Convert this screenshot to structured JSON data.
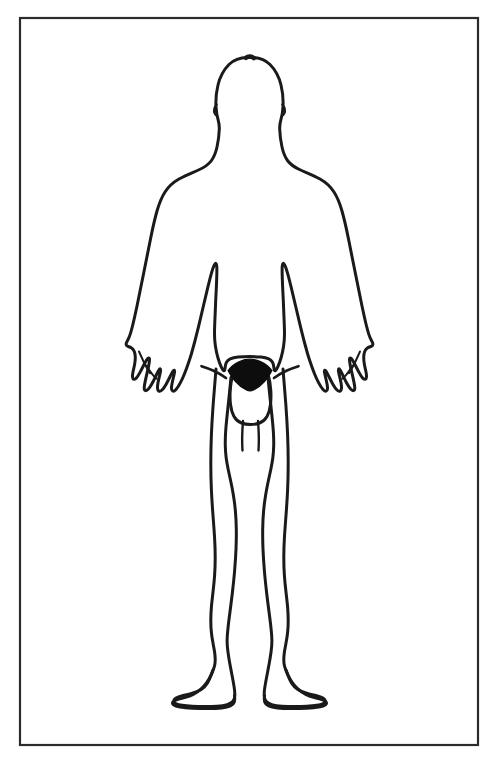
{
  "document": {
    "type": "anatomical-body-diagram",
    "title": "Human Body Outline Diagram",
    "view": "anterior",
    "subject_sex": "male",
    "style": "black-line-art-on-white",
    "labels": [],
    "annotations": [],
    "caption": ""
  },
  "colors": {
    "background": "#ffffff",
    "outline": "#1a1a1a",
    "frame": "#2b2b2b",
    "fill_pubic": "#0d0d0d",
    "speck": "#d8d8d8"
  },
  "frame": {
    "name": "border-rectangle",
    "x": 20,
    "y": 18,
    "width": 458,
    "height": 727,
    "stroke_width": 2.2,
    "fill": "none"
  },
  "figure": {
    "name": "human-body-outline",
    "stroke_width": 3.0,
    "parts": [
      {
        "name": "head",
        "filled": false
      },
      {
        "name": "neck",
        "filled": false
      },
      {
        "name": "torso",
        "filled": false
      },
      {
        "name": "left-arm",
        "filled": false
      },
      {
        "name": "right-arm",
        "filled": false
      },
      {
        "name": "left-hand",
        "filled": false
      },
      {
        "name": "right-hand",
        "filled": false
      },
      {
        "name": "left-leg",
        "filled": false
      },
      {
        "name": "right-leg",
        "filled": false
      },
      {
        "name": "left-foot",
        "filled": false
      },
      {
        "name": "right-foot",
        "filled": false
      },
      {
        "name": "genitalia",
        "filled": false
      },
      {
        "name": "pubic-hair-triangle",
        "filled": true
      }
    ],
    "facial_features": "none",
    "bounds": {
      "top": 56,
      "bottom": 714,
      "left": 126,
      "right": 372
    },
    "body_outline_path": "M 249.5 57.5 C 241.5 57.0 234.0 59.5 229.0 64.5 C 223.5 70.0 219.8 77.5 218.0 85.0 C 216.3 92.0 215.6 99.5 216.0 106.5 C 216.3 111.6 217.0 116.2 218.2 120.2 C 219.0 123.0 219.4 126.0 219.3 129.0 C 219.1 135.5 218.2 141.5 217.0 147.0 C 215.8 152.4 214.0 157.0 211.5 160.5 C 208.5 164.6 204.0 167.6 198.5 170.0 C 192.0 172.9 185.0 175.6 179.0 179.0 C 173.0 182.4 168.5 186.5 165.0 192.0 C 161.5 197.5 159.0 204.0 157.0 211.0 C 154.6 219.5 152.5 229.0 150.5 239.0 C 148.2 250.5 145.8 262.5 143.5 274.0 C 141.2 285.5 139.0 296.5 137.0 306.0 C 135.3 314.0 133.8 320.8 132.5 326.0 C 131.3 330.8 130.2 334.5 129.2 337.0 C 128.4 339.0 127.6 340.4 127.0 341.5 C 126.3 342.7 126.0 343.7 126.2 344.6 C 126.4 345.6 127.2 346.2 128.2 346.5 C 129.4 346.9 130.6 347.3 131.6 348.0 C 132.8 348.8 133.7 350.0 134.3 351.5 C 135.0 353.2 135.3 355.2 135.3 357.4 C 135.3 359.8 135.0 362.4 134.5 365.0 C 134.0 367.6 133.4 370.0 133.0 372.0 C 132.6 374.0 132.4 375.6 132.5 376.8 C 132.6 378.2 133.1 379.0 133.9 379.2 C 134.8 379.4 135.7 378.9 136.6 377.8 C 137.7 376.5 138.8 374.6 140.0 372.4 C 141.3 370.0 142.6 367.4 143.8 365.0 C 144.9 362.8 145.9 361.0 146.7 359.8 C 147.5 358.6 148.1 358.0 148.6 358.0 C 149.2 358.0 149.5 358.6 149.5 359.8 C 149.5 361.2 149.2 363.2 148.7 365.6 C 148.2 368.2 147.5 371.2 146.8 374.2 C 146.1 377.2 145.5 380.0 145.0 382.4 C 144.5 384.8 144.2 386.7 144.2 388.0 C 144.2 389.5 144.6 390.4 145.4 390.6 C 146.3 390.8 147.3 390.2 148.4 389.0 C 149.6 387.6 150.9 385.6 152.2 383.2 C 153.5 380.8 154.8 378.2 155.9 375.8 C 157.0 373.5 157.9 371.6 158.6 370.4 C 159.3 369.2 159.8 368.7 160.2 368.9 C 160.6 369.1 160.7 369.9 160.5 371.2 C 160.3 372.6 159.9 374.4 159.4 376.4 C 158.9 378.5 158.4 380.7 158.0 382.8 C 157.6 384.9 157.4 386.7 157.5 388.2 C 157.6 389.8 158.0 390.8 158.8 391.2 C 159.7 391.6 160.8 391.2 162.0 390.0 C 163.3 388.7 164.7 386.7 166.0 384.4 C 167.4 382.0 168.7 379.4 169.9 377.0 C 171.0 374.8 171.9 373.0 172.6 371.8 C 173.3 370.6 173.8 370.0 174.2 370.2 C 174.6 370.4 174.7 371.2 174.5 372.4 C 174.3 373.8 173.9 375.5 173.4 377.5 C 172.9 379.6 172.4 381.7 172.0 383.7 C 171.6 385.7 171.4 387.4 171.5 388.7 C 171.6 390.1 172.0 390.9 172.8 391.1 C 173.7 391.3 174.8 390.7 176.0 389.4 C 177.4 387.9 178.9 385.6 180.3 382.9 C 181.8 380.1 183.2 377.0 184.4 374.0 C 185.6 371.0 186.6 368.3 187.4 366.0 C 188.2 363.7 188.8 362.0 189.2 360.8 C 189.8 359.0 190.6 356.6 191.5 353.5 C 192.5 350.0 193.6 346.0 194.8 341.5 C 196.1 336.5 197.5 331.0 198.9 325.2 C 200.4 319.0 201.9 312.5 203.4 306.0 C 204.9 299.5 206.4 293.2 207.8 287.4 C 209.1 282.0 210.3 277.2 211.4 273.3 C 212.4 269.8 213.3 267.1 214.1 265.4 C 214.8 263.9 215.4 263.2 215.9 263.4 C 216.4 263.6 216.7 264.6 216.8 266.4 C 216.9 268.5 216.9 271.4 216.8 275.0 C 216.7 279.0 216.5 283.6 216.3 288.5 C 216.0 294.0 215.7 299.8 215.5 305.5 C 215.2 311.5 215.0 317.2 214.8 322.2 C 214.6 327.0 214.5 331.0 214.5 334.0 C 214.5 338.0 214.8 342.0 215.4 346.0 C 216.0 350.2 216.9 354.2 218.0 358.0 C 219.0 361.4 220.0 364.2 221.0 366.4 C 221.9 368.4 222.6 369.7 223.2 370.3 C 223.8 371.0 224.2 371.0 224.5 370.4 C 224.8 369.8 225.0 368.6 225.2 367.0 C 225.4 365.2 225.8 363.5 226.5 362.2 C 227.3 360.7 228.5 359.6 230.2 358.8 C 232.2 357.9 234.8 357.3 238.0 357.0 C 241.5 356.7 245.5 356.6 249.5 356.6 C 253.5 356.6 257.5 356.7 261.0 357.0 C 264.2 357.3 266.8 357.9 268.8 358.8 C 270.5 359.6 271.7 360.7 272.5 362.2 C 273.2 363.5 273.6 365.2 273.8 367.0 C 274.0 368.6 274.2 369.8 274.5 370.4 C 274.8 371.0 275.2 371.0 275.8 370.3 C 276.4 369.7 277.1 368.4 278.0 366.4 C 279.0 364.2 280.0 361.4 281.0 358.0 C 282.1 354.2 283.0 350.2 283.6 346.0 C 284.2 342.0 284.5 338.0 284.5 334.0 C 284.5 331.0 284.4 327.0 284.2 322.2 C 284.0 317.2 283.8 311.5 283.5 305.5 C 283.3 299.8 283.0 294.0 282.7 288.5 C 282.5 283.6 282.3 279.0 282.2 275.0 C 282.1 271.4 282.1 268.5 282.2 266.4 C 282.3 264.6 282.6 263.6 283.1 263.4 C 283.6 263.2 284.2 263.9 284.9 265.4 C 285.7 267.1 286.6 269.8 287.6 273.3 C 288.7 277.2 289.9 282.0 291.2 287.4 C 292.6 293.2 294.1 299.5 295.6 306.0 C 297.1 312.5 298.6 319.0 300.1 325.2 C 301.5 331.0 302.9 336.5 304.2 341.5 C 305.4 346.0 306.5 350.0 307.5 353.5 C 308.4 356.6 309.2 359.0 309.8 360.8 C 310.2 362.0 310.8 363.7 311.6 366.0 C 312.4 368.3 313.4 371.0 314.6 374.0 C 315.8 377.0 317.2 380.1 318.7 382.9 C 320.1 385.6 321.6 387.9 323.0 389.4 C 324.2 390.7 325.3 391.3 326.2 391.1 C 327.0 390.9 327.4 390.1 327.5 388.7 C 327.6 387.4 327.4 385.7 327.0 383.7 C 326.6 381.7 326.1 379.6 325.6 377.5 C 325.1 375.5 324.7 373.8 324.5 372.4 C 324.3 371.2 324.4 370.4 324.8 370.2 C 325.2 370.0 325.7 370.6 326.4 371.8 C 327.1 373.0 328.0 374.8 329.1 377.0 C 330.3 379.4 331.6 382.0 333.0 384.4 C 334.3 386.7 335.7 388.7 337.0 390.0 C 338.2 391.2 339.3 391.6 340.2 391.2 C 341.0 390.8 341.4 389.8 341.5 388.2 C 341.6 386.7 341.4 384.9 341.0 382.8 C 340.6 380.7 340.1 378.5 339.6 376.4 C 339.1 374.4 338.7 372.6 338.5 371.2 C 338.3 369.9 338.4 369.1 338.8 368.9 C 339.2 368.7 339.7 369.2 340.4 370.4 C 341.1 371.6 342.0 373.5 343.1 375.8 C 344.2 378.2 345.5 380.8 346.8 383.2 C 348.1 385.6 349.4 387.6 350.6 389.0 C 351.7 390.2 352.7 390.8 353.6 390.6 C 354.4 390.4 354.8 389.5 354.8 388.0 C 354.8 386.7 354.5 384.8 354.0 382.4 C 353.5 380.0 352.9 377.2 352.2 374.2 C 351.5 371.2 350.8 368.2 350.3 365.6 C 349.8 363.2 349.5 361.2 349.5 359.8 C 349.5 358.6 349.8 358.0 350.4 358.0 C 350.9 358.0 351.5 358.6 352.3 359.8 C 353.1 361.0 354.1 362.8 355.2 365.0 C 356.4 367.4 357.7 370.0 359.0 372.4 C 360.2 374.6 361.3 376.5 362.4 377.8 C 363.3 378.9 364.2 379.4 365.1 379.2 C 365.9 379.0 366.4 378.2 366.5 376.8 C 366.6 375.6 366.4 374.0 366.0 372.0 C 365.6 370.0 365.0 367.6 364.5 365.0 C 364.0 362.4 363.7 359.8 363.7 357.4 C 363.7 355.2 364.0 353.2 364.7 351.5 C 365.3 350.0 366.2 348.8 367.4 348.0 C 368.4 347.3 369.6 346.9 370.8 346.5 C 371.8 346.2 372.6 345.6 372.8 344.6 C 373.0 343.7 372.7 342.7 372.0 341.5 C 371.4 340.4 370.6 339.0 369.8 337.0 C 368.8 334.5 367.7 330.8 366.5 326.0 C 365.2 320.8 363.7 314.0 362.0 306.0 C 360.0 296.5 357.8 285.5 355.5 274.0 C 353.2 262.5 350.8 250.5 348.5 239.0 C 346.5 229.0 344.4 219.5 342.0 211.0 C 340.0 204.0 337.5 197.5 334.0 192.0 C 330.5 186.5 326.0 182.4 320.0 179.0 C 314.0 175.6 307.0 172.9 300.5 170.0 C 295.0 167.6 290.5 164.6 287.5 160.5 C 285.0 157.0 283.2 152.4 282.0 147.0 C 280.8 141.5 279.9 135.5 279.7 129.0 C 279.6 126.0 280.0 123.0 280.8 120.2 C 282.0 116.2 282.7 111.6 283.0 106.5 C 283.4 99.5 282.7 92.0 281.0 85.0 C 279.2 77.5 275.5 70.0 270.0 64.5 C 265.0 59.5 257.5 57.0 249.5 57.5 Z",
    "leg_path_left": "M 216.0 369.0 C 215.0 381.0 214.0 393.0 213.2 404.0 C 212.4 415.0 211.8 425.0 211.4 434.5 C 211.0 444.5 210.8 454.0 210.8 463.0 C 210.8 472.5 211.0 481.5 211.4 490.0 C 211.8 499.0 212.4 507.5 213.0 515.5 C 213.6 523.5 214.2 531.0 214.6 538.0 C 215.0 545.0 215.2 551.5 215.2 557.5 C 215.2 564.0 215.0 570.0 214.6 575.5 C 214.2 581.5 213.6 587.0 213.0 592.0 C 212.4 597.5 211.8 602.5 211.4 607.0 C 211.0 612.0 210.8 616.5 210.8 620.5 C 210.8 625.0 211.0 629.0 211.4 632.5 C 211.8 636.5 212.4 640.0 213.0 643.0 C 213.6 646.5 214.2 649.5 214.6 652.0 C 215.0 655.0 215.2 657.5 215.2 659.5 C 215.2 662.0 215.0 664.0 214.6 665.5 C 214.2 667.5 213.6 669.0 213.0 670.5 C 212.2 672.5 211.4 674.5 210.6 676.5 C 209.6 679.0 208.5 681.5 207.2 683.5 C 205.6 686.0 203.6 688.0 201.2 689.5 C 198.4 691.2 195.0 692.5 191.5 693.5 C 188.0 694.5 184.5 695.2 181.5 696.0 C 179.0 696.7 177.0 697.4 175.6 698.2 C 174.4 698.9 173.8 699.8 173.8 700.8 C 173.8 701.9 174.5 702.8 175.8 703.5 C 177.4 704.3 179.6 704.9 182.2 705.3 C 185.2 705.8 188.6 706.1 192.2 706.3 C 196.2 706.5 200.4 706.6 204.5 706.6 C 209.0 706.6 213.2 706.5 217.0 706.2 C 221.0 705.9 224.5 705.4 227.2 704.6 C 229.8 703.8 231.8 702.7 233.0 701.2 C 234.1 699.8 234.7 698.0 234.8 695.8 C 234.9 693.4 234.7 690.6 234.2 687.5 C 233.7 684.0 233.0 680.2 232.2 676.2 C 231.4 672.0 230.6 667.7 229.8 663.5 C 229.0 659.2 228.4 655.2 227.9 651.5 C 227.4 647.5 227.1 644.0 227.1 641.0 C 227.1 637.5 227.4 633.5 227.9 629.0 C 228.4 624.0 229.1 618.5 229.9 612.5 C 230.7 606.2 231.6 599.5 232.4 592.5 C 233.2 585.5 234.0 578.2 234.6 571.0 C 235.2 563.5 235.7 556.2 236.0 549.2 C 236.3 542.0 236.4 535.2 236.3 529.0 C 236.2 522.5 235.9 516.5 235.4 511.0 C 234.9 505.2 234.2 500.0 233.4 495.2 C 232.6 490.2 231.7 485.7 230.8 481.5 C 229.9 477.2 229.0 473.2 228.2 469.5 C 227.4 465.5 226.7 461.8 226.2 458.0 C 225.7 454.0 225.4 450.0 225.3 446.0 C 225.2 441.7 225.3 437.2 225.6 432.5 C 225.9 427.5 226.4 422.2 227.0 416.5 C 227.6 410.5 228.3 404.2 229.0 397.5 C 229.7 390.8 230.4 384.0 231.0 377.5",
    "leg_path_right": "M 283.0 369.0 C 284.0 381.0 285.0 393.0 285.8 404.0 C 286.6 415.0 287.2 425.0 287.6 434.5 C 288.0 444.5 288.2 454.0 288.2 463.0 C 288.2 472.5 288.0 481.5 287.6 490.0 C 287.2 499.0 286.6 507.5 286.0 515.5 C 285.4 523.5 284.8 531.0 284.4 538.0 C 284.0 545.0 283.8 551.5 283.8 557.5 C 283.8 564.0 284.0 570.0 284.4 575.5 C 284.8 581.5 285.4 587.0 286.0 592.0 C 286.6 597.5 287.2 602.5 287.6 607.0 C 288.0 612.0 288.2 616.5 288.2 620.5 C 288.2 625.0 288.0 629.0 287.6 632.5 C 287.2 636.5 286.6 640.0 286.0 643.0 C 285.4 646.5 284.8 649.5 284.4 652.0 C 284.0 655.0 283.8 657.5 283.8 659.5 C 283.8 662.0 284.0 664.0 284.4 665.5 C 284.8 667.5 285.4 669.0 286.0 670.5 C 286.8 672.5 287.6 674.5 288.4 676.5 C 289.4 679.0 290.5 681.5 291.8 683.5 C 293.4 686.0 295.4 688.0 297.8 689.5 C 300.6 691.2 304.0 692.5 307.5 693.5 C 311.0 694.5 314.5 695.2 317.5 696.0 C 320.0 696.7 322.0 697.4 323.4 698.2 C 324.6 698.9 325.2 699.8 325.2 700.8 C 325.2 701.9 324.5 702.8 323.2 703.5 C 321.6 704.3 319.4 704.9 316.8 705.3 C 313.8 705.8 310.4 706.1 306.8 706.3 C 302.8 706.5 298.6 706.6 294.5 706.6 C 290.0 706.6 285.8 706.5 282.0 706.2 C 278.0 705.9 274.5 705.4 271.8 704.6 C 269.2 703.8 267.2 702.7 266.0 701.2 C 264.9 699.8 264.3 698.0 264.2 695.8 C 264.1 693.4 264.3 690.6 264.8 687.5 C 265.3 684.0 266.0 680.2 266.8 676.2 C 267.6 672.0 268.4 667.7 269.2 663.5 C 270.0 659.2 270.6 655.2 271.1 651.5 C 271.6 647.5 271.9 644.0 271.9 641.0 C 271.9 637.5 271.6 633.5 271.1 629.0 C 270.6 624.0 269.9 618.5 269.1 612.5 C 268.3 606.2 267.4 599.5 266.6 592.5 C 265.8 585.5 265.0 578.2 264.4 571.0 C 263.8 563.5 263.3 556.2 263.0 549.2 C 262.7 542.0 262.6 535.2 262.7 529.0 C 262.8 522.5 263.1 516.5 263.6 511.0 C 264.1 505.2 264.8 500.0 265.6 495.2 C 266.4 490.2 267.3 485.7 268.2 481.5 C 269.1 477.2 270.0 473.2 270.8 469.5 C 271.6 465.5 272.3 461.8 272.8 458.0 C 273.3 454.0 273.6 450.0 273.7 446.0 C 273.8 441.7 273.7 437.2 273.4 432.5 C 273.1 427.5 272.6 422.2 272.0 416.5 C 271.4 410.5 270.7 404.2 270.0 397.5 C 269.3 390.8 268.6 384.0 268.0 377.5",
    "genitalia_path": "M 232.5 376.0 C 231.2 380.5 230.5 385.5 230.2 390.5 C 229.9 395.5 230.0 400.5 230.6 405.0 C 231.2 409.5 232.3 413.5 234.0 416.5 C 235.8 419.6 238.3 421.8 241.5 423.0 C 244.3 424.1 247.5 424.5 250.5 424.5 C 253.5 424.5 256.7 424.1 259.5 423.0 C 262.7 421.8 265.2 419.6 267.0 416.5 C 268.7 413.5 269.8 409.5 270.4 405.0 C 271.0 400.5 271.1 395.5 270.8 390.5 C 270.5 385.5 269.8 380.5 268.5 376.0",
    "penis_path": "M 243.0 421.0 C 242.6 426.0 242.3 431.0 242.2 436.0 C 242.1 441.0 242.2 446.0 242.5 450.5 M 258.0 421.0 C 258.4 426.0 258.7 431.0 258.8 436.0 C 258.9 441.0 258.8 446.0 258.5 450.5",
    "pubic_triangle_path": "M 228.0 370.5 C 231.0 366.5 235.0 363.5 239.5 361.5 C 243.0 360.0 246.5 359.2 250.0 359.2 C 253.5 359.2 257.0 360.0 260.5 361.5 C 265.0 363.5 269.0 366.5 272.0 370.5 C 270.0 374.5 267.5 378.2 264.5 381.5 C 261.2 385.2 257.4 388.2 253.5 390.0 C 252.3 390.6 251.1 390.9 250.0 390.9 C 248.9 390.9 247.7 390.6 246.5 390.0 C 242.6 388.2 238.8 385.2 235.5 381.5 C 232.5 378.2 230.0 374.5 228.0 370.5 Z",
    "hip_crease_left": "M 226.0 378.0 C 222.0 375.0 217.5 372.5 213.0 370.5 C 209.0 368.7 205.0 367.3 201.5 366.2",
    "hip_crease_right": "M 274.0 378.0 C 278.0 375.0 282.5 372.5 287.0 370.5 C 291.0 368.7 295.0 367.3 298.5 366.2",
    "foot_left_path": "M 213.0 670.0 C 211.0 676.0 208.0 681.5 204.0 686.0 C 200.0 690.5 195.0 694.0 189.5 696.0 C 185.5 697.4 181.5 698.2 178.0 699.2 C 175.5 700.0 173.8 700.9 173.0 702.0 C 172.3 703.0 172.4 704.0 173.5 704.9 C 174.8 705.9 177.0 706.6 180.0 707.1 C 183.5 707.7 187.8 708.0 192.5 708.2 C 197.5 708.4 202.8 708.5 208.0 708.5 C 213.0 708.5 217.6 708.4 221.5 708.0 C 225.2 707.6 228.2 707.0 230.4 706.0 C 232.4 705.1 233.7 703.8 234.3 702.0 C 234.9 700.2 234.9 698.0 234.5 695.5",
    "foot_right_path": "M 286.0 670.0 C 288.0 676.0 291.0 681.5 295.0 686.0 C 299.0 690.5 304.0 694.0 309.5 696.0 C 313.5 697.4 317.5 698.2 321.0 699.2 C 323.5 700.0 325.2 700.9 326.0 702.0 C 326.7 703.0 326.6 704.0 325.5 704.9 C 324.2 705.9 322.0 706.6 319.0 707.1 C 315.5 707.7 311.2 708.0 306.5 708.2 C 301.5 708.4 296.2 708.5 291.0 708.5 C 286.0 708.5 281.4 708.4 277.5 708.0 C 273.8 707.6 270.8 707.0 268.6 706.0 C 266.6 705.1 265.3 703.8 264.7 702.0 C 264.1 700.2 264.1 698.0 264.5 695.5",
    "hand_left_inner": "M 139.0 351.5 C 141.0 356.0 143.0 360.5 145.0 364.5 C 146.8 368.0 148.5 371.0 150.0 373.2 M 146.5 365.5 C 148.5 369.0 150.5 372.0 152.4 374.4 C 154.0 376.4 155.5 377.9 156.8 378.8",
    "hand_right_inner": "M 360.0 351.5 C 358.0 356.0 356.0 360.5 354.0 364.5 C 352.2 368.0 350.5 371.0 349.0 373.2 M 352.5 365.5 C 350.5 369.0 348.5 372.0 346.6 374.4 C 345.0 376.4 343.5 377.9 342.2 378.8",
    "ear_notch_left": "M 216.8 104.5 C 215.5 105.5 214.6 107.0 214.2 108.8 C 213.8 110.6 214.0 112.4 214.8 113.8 C 215.4 114.9 216.2 115.6 217.2 115.8",
    "ear_notch_right": "M 282.2 104.5 C 283.5 105.5 284.4 107.0 284.8 108.8 C 285.2 110.6 285.0 112.4 284.2 113.8 C 283.6 114.9 282.8 115.6 281.8 115.8",
    "crown_mark": "M 246.0 57.8 C 247.2 56.8 248.8 56.4 250.4 56.6 C 251.8 56.8 253.0 57.4 253.8 58.2"
  },
  "artifacts": [
    {
      "name": "scan-speck-top",
      "x": 277,
      "y": 3,
      "width": 2,
      "height": 8
    }
  ]
}
